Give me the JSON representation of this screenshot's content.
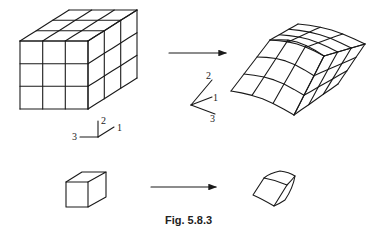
{
  "figure": {
    "caption": "Fig. 5.8.3",
    "undeformed_mesh": {
      "divisions": [
        3,
        3,
        3
      ]
    },
    "deformed_mesh": {
      "divisions": [
        3,
        3,
        3
      ]
    },
    "axes_left": {
      "labels": [
        "1",
        "2",
        "3"
      ]
    },
    "axes_right": {
      "labels": [
        "1",
        "2",
        "3"
      ]
    },
    "arrows": [
      "deform-arrow-top",
      "deform-arrow-bottom"
    ],
    "line_color": "#1a1a1a"
  }
}
